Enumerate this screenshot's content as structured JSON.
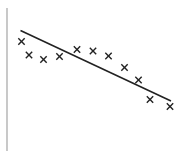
{
  "chart_data": {
    "type": "scatter",
    "title": "",
    "xlabel": "",
    "ylabel": "",
    "grid": false,
    "legend": null,
    "points": [
      {
        "x": 1,
        "y": 7.4
      },
      {
        "x": 2,
        "y": 6.2
      },
      {
        "x": 3,
        "y": 5.8
      },
      {
        "x": 4,
        "y": 6.0
      },
      {
        "x": 5,
        "y": 6.7
      },
      {
        "x": 6,
        "y": 6.5
      },
      {
        "x": 7,
        "y": 6.1
      },
      {
        "x": 8,
        "y": 5.1
      },
      {
        "x": 9,
        "y": 3.9
      },
      {
        "x": 10,
        "y": 2.2
      },
      {
        "x": 11,
        "y": 1.5
      }
    ],
    "trendline": {
      "type": "linear",
      "from": {
        "x": 1,
        "y": 8.4
      },
      "to": {
        "x": 11,
        "y": 2.1
      }
    },
    "marker": "x",
    "colors": {
      "marker": "#222222",
      "trendline": "#222222",
      "axis": "#bbbbbb"
    }
  },
  "plot_pixels": {
    "axis": {
      "x": 7,
      "y1": 8,
      "y2": 151
    },
    "points": [
      [
        21.5,
        41.5
      ],
      [
        29,
        55
      ],
      [
        43.5,
        59.5
      ],
      [
        59.5,
        56.5
      ],
      [
        77,
        49.5
      ],
      [
        93,
        51
      ],
      [
        108.5,
        56
      ],
      [
        124.5,
        67.5
      ],
      [
        138.5,
        80
      ],
      [
        150,
        99.5
      ],
      [
        170,
        106.5
      ]
    ],
    "line": [
      [
        20.5,
        30.5
      ],
      [
        171,
        101
      ]
    ]
  }
}
